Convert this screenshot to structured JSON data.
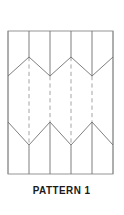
{
  "figure": {
    "caption": "PATTERN 1",
    "caption_name": "pattern-1",
    "colors": {
      "background": "#ffffff",
      "frame_stroke": "#8a8a8a",
      "fold_solid_stroke": "#707070",
      "fold_dashed_stroke": "#9a9a9a",
      "caption_text": "#1a1a1a"
    }
  },
  "chart_data": {
    "type": "diagram",
    "title": "PATTERN 1",
    "subtitle": "",
    "xlabel": "",
    "ylabel": "",
    "grid": false,
    "legend": "none",
    "xlim": [
      8,
      113
    ],
    "ylim": [
      31,
      174
    ],
    "frame": {
      "name": "sheet-outline",
      "x": 8,
      "y": 31,
      "width": 105,
      "height": 143,
      "stroke": "#8a8a8a",
      "stroke_width": 0.9,
      "fill": "#ffffff"
    },
    "vertical_creases": [
      {
        "name": "vertical-crease-1",
        "x": 8,
        "style": "solid",
        "y_top": 31,
        "y_bottom": 174
      },
      {
        "name": "vertical-crease-2",
        "x": 29,
        "style": "mixed",
        "y_top": 31,
        "y_bottom": 174,
        "solid_spans": [
          [
            31,
            57
          ],
          [
            145,
            174
          ]
        ],
        "dashed_spans": [
          [
            57,
            145
          ]
        ]
      },
      {
        "name": "vertical-crease-3",
        "x": 50,
        "style": "mixed",
        "y_top": 31,
        "y_bottom": 174,
        "solid_spans": [
          [
            31,
            76
          ],
          [
            122,
            174
          ]
        ],
        "dashed_spans": [
          [
            76,
            122
          ]
        ]
      },
      {
        "name": "vertical-crease-4",
        "x": 71,
        "style": "mixed",
        "y_top": 31,
        "y_bottom": 174,
        "solid_spans": [
          [
            31,
            57
          ],
          [
            145,
            174
          ]
        ],
        "dashed_spans": [
          [
            57,
            145
          ]
        ]
      },
      {
        "name": "vertical-crease-5",
        "x": 92,
        "style": "mixed",
        "y_top": 31,
        "y_bottom": 174,
        "solid_spans": [
          [
            31,
            76
          ],
          [
            122,
            174
          ]
        ],
        "dashed_spans": [
          [
            76,
            122
          ]
        ]
      },
      {
        "name": "vertical-crease-6",
        "x": 113,
        "style": "solid",
        "y_top": 31,
        "y_bottom": 174
      }
    ],
    "zigzag_bands": [
      {
        "name": "upper-chevron-band",
        "style": "solid",
        "points": [
          [
            8,
            76
          ],
          [
            29,
            57
          ],
          [
            50,
            76
          ],
          [
            71,
            57
          ],
          [
            92,
            76
          ],
          [
            113,
            57
          ]
        ],
        "peak_y": 57,
        "valley_y": 76
      },
      {
        "name": "lower-chevron-band",
        "style": "solid",
        "points": [
          [
            8,
            122
          ],
          [
            29,
            145
          ],
          [
            50,
            122
          ],
          [
            71,
            145
          ],
          [
            92,
            122
          ],
          [
            113,
            145
          ]
        ],
        "peak_y": 122,
        "valley_y": 145
      }
    ]
  }
}
